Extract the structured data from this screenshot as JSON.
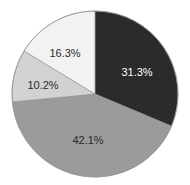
{
  "chart_data": {
    "type": "pie",
    "title": "",
    "start_angle_deg": 0,
    "direction": "clockwise",
    "slices": [
      {
        "label": "31.3%",
        "value": 31.3,
        "color": "#2b2b2b",
        "label_color": "#ffffff",
        "label_pos": [
          137,
          76
        ]
      },
      {
        "label": "42.1%",
        "value": 42.1,
        "color": "#9b9b9b",
        "label_color": "#2a2a2a",
        "label_pos": [
          88,
          144
        ]
      },
      {
        "label": "10.2%",
        "value": 10.2,
        "color": "#d2d2d2",
        "label_color": "#2a2a2a",
        "label_pos": [
          43,
          89
        ]
      },
      {
        "label": "16.3%",
        "value": 16.3,
        "color": "#f2f2f2",
        "label_color": "#2a2a2a",
        "label_pos": [
          65,
          57
        ]
      }
    ],
    "legend": null,
    "geometry": {
      "cx": 95,
      "cy": 94,
      "r": 83
    }
  }
}
